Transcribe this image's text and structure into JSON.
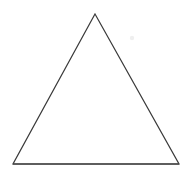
{
  "figure": {
    "type": "geometric-shape",
    "shape_name": "triangle",
    "classification": "isoceles-triangle",
    "orientation": "apex-up",
    "filled": false,
    "label_text": "",
    "background_color": "#ffffff",
    "stroke_color": "#3a3a3a",
    "baseline_stroke_color": "#4a4a4a",
    "stroke_width": 1.2,
    "canvas": {
      "width": 192,
      "height": 174
    },
    "vertices": [
      {
        "name": "apex",
        "x": 95,
        "y": 14
      },
      {
        "name": "bottom-right",
        "x": 179,
        "y": 164
      },
      {
        "name": "bottom-left",
        "x": 13,
        "y": 164
      }
    ],
    "polygon_points": "95,14 179,164 13,164",
    "baseline": {
      "x1": 13,
      "y1": 164,
      "x2": 179,
      "y2": 164
    },
    "edges": [
      {
        "name": "left-edge",
        "from": "apex",
        "to": "bottom-left"
      },
      {
        "name": "right-edge",
        "from": "apex",
        "to": "bottom-right"
      },
      {
        "name": "base-edge",
        "from": "bottom-left",
        "to": "bottom-right"
      }
    ],
    "measurements": {
      "base_width": 166,
      "height": 150
    },
    "artifact": {
      "name": "faint-speck",
      "x": 132,
      "y": 38,
      "radius": 2.2,
      "color": "#efefef"
    }
  }
}
